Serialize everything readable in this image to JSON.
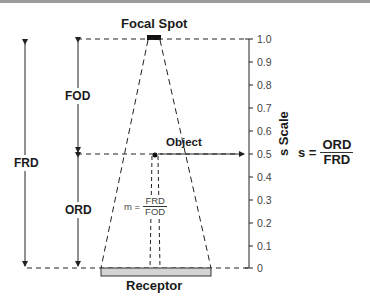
{
  "labels": {
    "focal_spot": "Focal Spot",
    "object": "Object",
    "receptor": "Receptor",
    "fod": "FOD",
    "ord": "ORD",
    "frd": "FRD",
    "scale_axis": "s Scale"
  },
  "formulas": {
    "magnification": {
      "lhs": "m =",
      "num": "FRD",
      "den": "FOD"
    },
    "scale": {
      "lhs": "s =",
      "num": "ORD",
      "den": "FRD"
    }
  },
  "scale_ticks": [
    "1.0",
    "0.9",
    "0.8",
    "0.7",
    "0.6",
    "0.5",
    "0.4",
    "0.3",
    "0.2",
    "0.1",
    "0"
  ],
  "colors": {
    "receptor_fill": "#d4d4d4",
    "line": "#222222"
  }
}
